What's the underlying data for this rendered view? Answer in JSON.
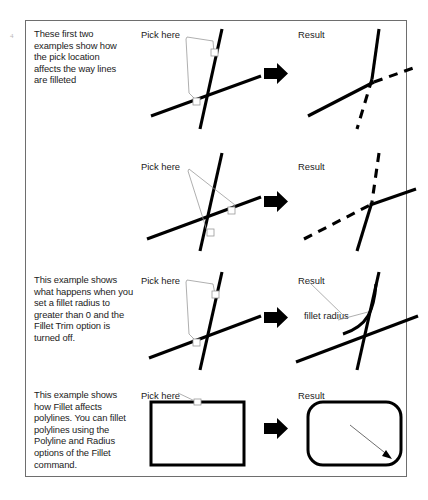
{
  "figure": {
    "edge_mark": "4",
    "rows": [
      {
        "id": "row-pick-upper-left",
        "description": "These first two examples show how the pick location affects the way lines are filleted",
        "pick_label": "Pick here",
        "result_label": "Result",
        "arrow_icon": "right-block-arrow",
        "radius_label": ""
      },
      {
        "id": "row-pick-lower-right",
        "description": "",
        "pick_label": "Pick here",
        "result_label": "Result",
        "arrow_icon": "right-block-arrow",
        "radius_label": ""
      },
      {
        "id": "row-fillet-radius-no-trim",
        "description": "This example shows what happens when you set a fillet radius to greater than 0 and the Fillet Trim option is turned off.",
        "pick_label": "Pick here",
        "result_label": "Result",
        "arrow_icon": "right-block-arrow",
        "radius_label": "fillet radius"
      },
      {
        "id": "row-polyline-fillet",
        "description": "This example shows how Fillet affects polylines. You can fillet polylines using the Polyline and Radius options of the Fillet command.",
        "pick_label": "Pick here",
        "result_label": "Result",
        "arrow_icon": "right-block-arrow",
        "radius_label": "fillet radius"
      }
    ],
    "colors": {
      "line": "#000000",
      "leader": "#9a9a9a",
      "frame": "#6e6e6e",
      "background": "#ffffff",
      "text": "#1b1b1b"
    }
  }
}
